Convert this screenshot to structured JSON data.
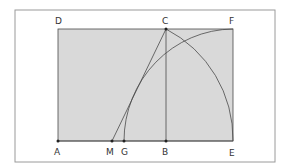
{
  "diagram": {
    "type": "golden-rectangle-construction",
    "colors": {
      "frame": "#9a9a9a",
      "fill": "#d9d9d9",
      "stroke": "#4a4a4a",
      "text": "#333333"
    },
    "points": {
      "A": {
        "label": "A",
        "x": 58,
        "y": 141
      },
      "B": {
        "label": "B",
        "x": 166,
        "y": 141
      },
      "C": {
        "label": "C",
        "x": 166,
        "y": 29
      },
      "D": {
        "label": "D",
        "x": 58,
        "y": 29
      },
      "E": {
        "label": "E",
        "x": 233,
        "y": 141
      },
      "F": {
        "label": "F",
        "x": 233,
        "y": 29
      },
      "G": {
        "label": "G",
        "x": 124,
        "y": 141
      },
      "M": {
        "label": "M",
        "x": 112,
        "y": 141
      }
    },
    "labels": {
      "A": "A",
      "B": "B",
      "C": "C",
      "D": "D",
      "E": "E",
      "F": "F",
      "G": "G",
      "M": "M"
    }
  }
}
